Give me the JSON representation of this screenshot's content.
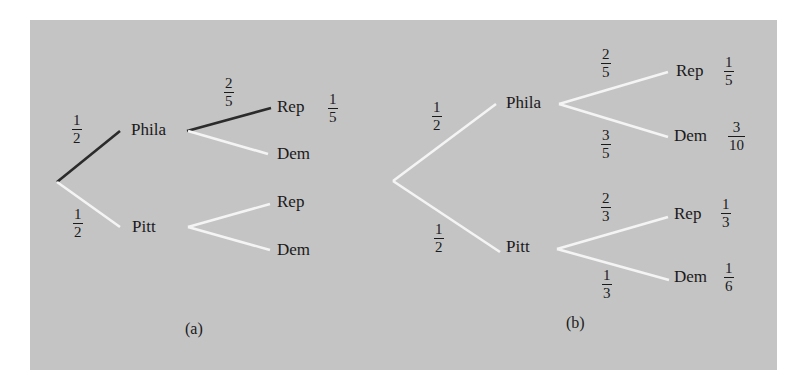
{
  "colors": {
    "background": "#c4c4c4",
    "highlight_path": "#2b2b2b",
    "branch": "#f4f4f4",
    "text": "#1a1a1a"
  },
  "panel_a": {
    "caption": "(a)",
    "root_edges": [
      {
        "to": "Phila",
        "prob": {
          "num": "1",
          "den": "2"
        },
        "highlighted": true
      },
      {
        "to": "Pitt",
        "prob": {
          "num": "1",
          "den": "2"
        },
        "highlighted": false
      }
    ],
    "nodes": {
      "phila": "Phila",
      "pitt": "Pitt",
      "phila_rep": "Rep",
      "phila_dem": "Dem",
      "pitt_rep": "Rep",
      "pitt_dem": "Dem"
    },
    "phila_rep_edge_prob": {
      "num": "2",
      "den": "5"
    },
    "phila_rep_result": {
      "num": "1",
      "den": "5"
    }
  },
  "panel_b": {
    "caption": "(b)",
    "nodes": {
      "phila": "Phila",
      "pitt": "Pitt",
      "phila_rep": "Rep",
      "phila_dem": "Dem",
      "pitt_rep": "Rep",
      "pitt_dem": "Dem"
    },
    "edge_probs": {
      "root_phila": {
        "num": "1",
        "den": "2"
      },
      "root_pitt": {
        "num": "1",
        "den": "2"
      },
      "phila_rep": {
        "num": "2",
        "den": "5"
      },
      "phila_dem": {
        "num": "3",
        "den": "5"
      },
      "pitt_rep": {
        "num": "2",
        "den": "3"
      },
      "pitt_dem": {
        "num": "1",
        "den": "3"
      }
    },
    "outcomes": {
      "phila_rep": {
        "num": "1",
        "den": "5"
      },
      "phila_dem": {
        "num": "3",
        "den": "10"
      },
      "pitt_rep": {
        "num": "1",
        "den": "3"
      },
      "pitt_dem": {
        "num": "1",
        "den": "6"
      }
    }
  }
}
